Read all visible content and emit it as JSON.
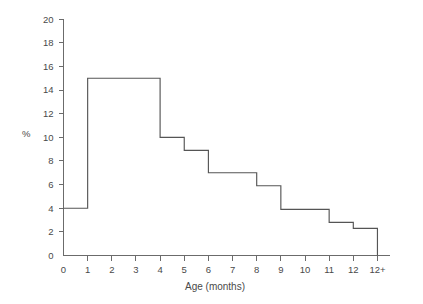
{
  "chart_data": {
    "type": "bar",
    "title": "",
    "subtitle": "",
    "xlabel": "Age (months)",
    "ylabel": "%",
    "xlim": [
      0,
      13
    ],
    "ylim": [
      0,
      20
    ],
    "grid": false,
    "legend": null,
    "style": "step-histogram-outline",
    "line_color": "#555555",
    "axis_color": "#6b6b6b",
    "background_color": "#ffffff",
    "x_tick_labels": [
      "0",
      "1",
      "2",
      "3",
      "4",
      "5",
      "6",
      "7",
      "8",
      "9",
      "10",
      "11",
      "12",
      "12+"
    ],
    "x_tick_values": [
      0,
      1,
      2,
      3,
      4,
      5,
      6,
      7,
      8,
      9,
      10,
      11,
      12,
      13
    ],
    "y_tick_labels": [
      "0",
      "2",
      "4",
      "6",
      "8",
      "10",
      "12",
      "14",
      "16",
      "18",
      "20"
    ],
    "y_tick_values": [
      0,
      2,
      4,
      6,
      8,
      10,
      12,
      14,
      16,
      18,
      20
    ],
    "bins": [
      {
        "label": "0–1",
        "x_start": 0,
        "x_end": 1,
        "value": 4.0
      },
      {
        "label": "1–4",
        "x_start": 1,
        "x_end": 4,
        "value": 15.0
      },
      {
        "label": "4–5",
        "x_start": 4,
        "x_end": 5,
        "value": 10.0
      },
      {
        "label": "5–6",
        "x_start": 5,
        "x_end": 6,
        "value": 8.9
      },
      {
        "label": "6–8",
        "x_start": 6,
        "x_end": 8,
        "value": 7.0
      },
      {
        "label": "8–9",
        "x_start": 8,
        "x_end": 9,
        "value": 5.9
      },
      {
        "label": "9–11",
        "x_start": 9,
        "x_end": 11,
        "value": 3.9
      },
      {
        "label": "11–12",
        "x_start": 11,
        "x_end": 12,
        "value": 2.8
      },
      {
        "label": "12+",
        "x_start": 12,
        "x_end": 13,
        "value": 2.3
      }
    ],
    "categories": [
      "0–1",
      "1–4",
      "4–5",
      "5–6",
      "6–8",
      "8–9",
      "9–11",
      "11–12",
      "12+"
    ],
    "values": [
      4.0,
      15.0,
      10.0,
      8.9,
      7.0,
      5.9,
      3.9,
      2.8,
      2.3
    ]
  }
}
